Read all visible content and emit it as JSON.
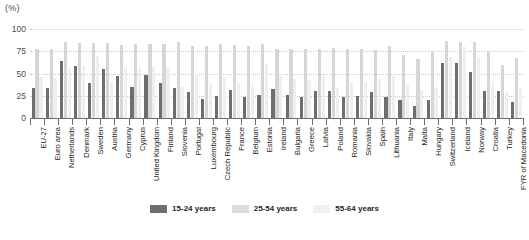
{
  "unit_label": "(%)",
  "legend": {
    "position": "bottom-center",
    "items": [
      {
        "label": "15-24 years",
        "color": "#6e6e6e"
      },
      {
        "label": "25-54 years",
        "color": "#dcdcdc"
      },
      {
        "label": "55-64 years",
        "color": "#f1f1f1"
      }
    ]
  },
  "chart_data": {
    "type": "bar",
    "title": "",
    "subtitle": "",
    "xlabel": "",
    "ylabel": "(%)",
    "ylim": [
      0,
      100
    ],
    "yticks": [
      0,
      25,
      50,
      75,
      100
    ],
    "grid": true,
    "orientation": "vertical",
    "grouping": "grouped",
    "categories": [
      "EU-27",
      "Euro area",
      "Netherlands",
      "Denmark",
      "Sweden",
      "Austria",
      "Germany",
      "Cyprus",
      "United Kingdom",
      "Finland",
      "Slovenia",
      "Portugal",
      "Luxembourg",
      "Czech Republic",
      "France",
      "Belgium",
      "Estonia",
      "Ireland",
      "Bulgaria",
      "Greece",
      "Latvia",
      "Poland",
      "Romania",
      "Slovakia",
      "Spain",
      "Lithuania",
      "Italy",
      "Malta",
      "Hungary",
      "Switzerland",
      "Iceland",
      "Norway",
      "Croatia",
      "Turkey",
      "FYR of Macedonia"
    ],
    "series": [
      {
        "name": "15-24 years",
        "color": "#6e6e6e",
        "values": [
          34,
          34,
          64,
          59,
          39,
          55,
          47,
          35,
          48,
          39,
          34,
          29,
          21,
          25,
          31,
          24,
          26,
          33,
          26,
          24,
          30,
          30,
          24,
          25,
          29,
          24,
          20,
          13,
          20,
          62,
          62,
          52,
          30,
          30,
          18
        ]
      },
      {
        "name": "25-54 years",
        "color": "#dcdcdc",
        "values": [
          77,
          77,
          85,
          84,
          84,
          84,
          82,
          83,
          83,
          83,
          85,
          81,
          81,
          83,
          82,
          81,
          83,
          77,
          78,
          78,
          78,
          79,
          77,
          78,
          76,
          81,
          71,
          66,
          75,
          87,
          85,
          85,
          74,
          60,
          67
        ]
      },
      {
        "name": "55-64 years",
        "color": "#efefef",
        "values": [
          46,
          45,
          55,
          58,
          70,
          41,
          57,
          56,
          57,
          56,
          35,
          49,
          39,
          46,
          39,
          37,
          61,
          50,
          44,
          43,
          48,
          34,
          41,
          40,
          44,
          48,
          37,
          31,
          34,
          68,
          80,
          69,
          39,
          29,
          34
        ]
      }
    ]
  }
}
